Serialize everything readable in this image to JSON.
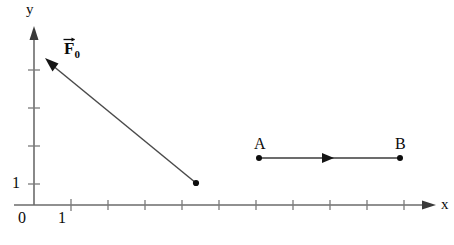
{
  "figure": {
    "type": "physics-vector-diagram",
    "background_color": "#ffffff",
    "ink_color": "#111111",
    "axis_color": "#6b6b6b"
  },
  "axes": {
    "y_label": "y",
    "x_label": "x",
    "origin_label": "0",
    "x_tick_label": "1",
    "y_tick_label": "1",
    "x_tick_count": 11,
    "y_tick_count": 4,
    "tick_spacing_px": 37
  },
  "force_vector": {
    "label_base": "F",
    "label_subscript": "0",
    "label_full": "F0",
    "has_vector_bar": true,
    "tail_x": 196,
    "tail_y": 183,
    "head_x": 46,
    "head_y": 60,
    "direction": "up-left"
  },
  "displacement": {
    "start_label": "A",
    "end_label": "B",
    "start_x": 259,
    "start_y": 158,
    "end_x": 400,
    "end_y": 158,
    "direction": "right"
  }
}
